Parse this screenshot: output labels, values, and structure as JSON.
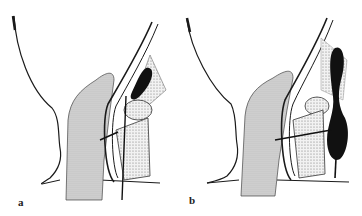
{
  "figure": {
    "panels": [
      {
        "id": "a",
        "label": "a"
      },
      {
        "id": "b",
        "label": "b"
      }
    ],
    "colors": {
      "ink": "#1a1a1a",
      "stipple_fill": "#cfcfcf",
      "dark_fill": "#111111",
      "background": "#ffffff"
    }
  }
}
